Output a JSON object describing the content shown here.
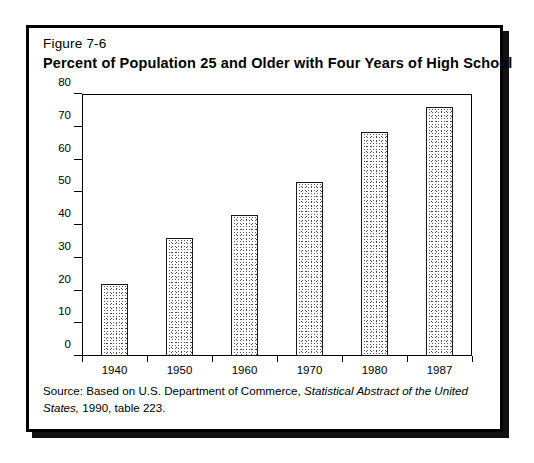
{
  "figure": {
    "label": "Figure 7-6",
    "title": "Percent of Population 25 and Older with Four Years of High School",
    "source_prefix": "Source:  Based on U.S. Department of Commerce, ",
    "source_italic": "Statistical Abstract of the United States,",
    "source_suffix": " 1990, table 223."
  },
  "colors": {
    "frame": "#000000",
    "bar_outline": "#1a1a1a",
    "bar_fill": "#ffffff",
    "bar_stipple": "#2b2b2b",
    "text": "#000000",
    "background": "#ffffff"
  },
  "chart_data": {
    "type": "bar",
    "title": "Percent of Population 25 and Older with Four Years of High School",
    "subtitle": "Figure 7-6",
    "categories": [
      "1940",
      "1950",
      "1960",
      "1970",
      "1980",
      "1987"
    ],
    "values": [
      22,
      36,
      43,
      53,
      68.5,
      76
    ],
    "xlabel": "",
    "ylabel": "",
    "ylim": [
      0,
      80
    ],
    "yticks": [
      0,
      10,
      20,
      30,
      40,
      50,
      60,
      70,
      80
    ],
    "ytick_labels": [
      "0",
      "10",
      "20",
      "30",
      "40",
      "50",
      "60",
      "70",
      "80"
    ],
    "grid": false,
    "legend": null,
    "bar_style": "stippled-fill-with-black-outline",
    "note": "Source:  Based on U.S. Department of Commerce, Statistical Abstract of the United States, 1990, table 223."
  }
}
